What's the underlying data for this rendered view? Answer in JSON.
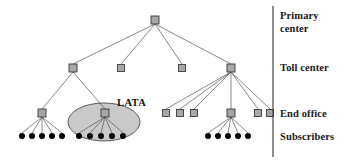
{
  "figure": {
    "background_color": "#ffffff",
    "width": 344,
    "height": 163
  },
  "style": {
    "switch_fill": "#a6a6a6",
    "switch_stroke": "#3b3b3b",
    "subscriber_fill": "#000000",
    "line_color": "#555555",
    "divider_color": "#333333",
    "lata_fill": "#c9c9c9",
    "lata_stroke": "#4a4a4a",
    "text_color": "#1a1a1a"
  },
  "divider": {
    "x": 273,
    "y1": 6,
    "y2": 157
  },
  "tier_labels": [
    {
      "id": "primary-center",
      "text": "Primary\ncenter",
      "x": 280,
      "y": 10
    },
    {
      "id": "toll-center",
      "text": "Toll center",
      "x": 280,
      "y": 62
    },
    {
      "id": "end-office",
      "text": "End office",
      "x": 280,
      "y": 108
    },
    {
      "id": "subscribers",
      "text": "Subscribers",
      "x": 280,
      "y": 131
    }
  ],
  "lata": {
    "label": "LATA",
    "label_x": 117,
    "label_y": 97,
    "ellipse": {
      "cx": 104,
      "cy": 122,
      "rx": 36,
      "ry": 19
    }
  },
  "nodes": {
    "primary_centers": [
      {
        "id": "pc-1",
        "x": 155,
        "y": 20,
        "size": 8
      }
    ],
    "toll_centers": [
      {
        "id": "tc-1",
        "x": 73,
        "y": 68,
        "size": 8
      },
      {
        "id": "tc-2",
        "x": 121,
        "y": 68,
        "size": 7
      },
      {
        "id": "tc-3",
        "x": 182,
        "y": 68,
        "size": 7
      },
      {
        "id": "tc-4",
        "x": 231,
        "y": 68,
        "size": 8
      }
    ],
    "end_offices": [
      {
        "id": "eo-1",
        "x": 42,
        "y": 113,
        "size": 8
      },
      {
        "id": "eo-2",
        "x": 105,
        "y": 113,
        "size": 8
      },
      {
        "id": "eo-3",
        "x": 166,
        "y": 113,
        "size": 7
      },
      {
        "id": "eo-4",
        "x": 180,
        "y": 113,
        "size": 7
      },
      {
        "id": "eo-5",
        "x": 194,
        "y": 113,
        "size": 7
      },
      {
        "id": "eo-6",
        "x": 231,
        "y": 113,
        "size": 8
      },
      {
        "id": "eo-7",
        "x": 258,
        "y": 113,
        "size": 7
      },
      {
        "id": "eo-8",
        "x": 270,
        "y": 113,
        "size": 7
      }
    ],
    "subscribers": [
      {
        "id": "sub-1",
        "x": 22,
        "y": 136,
        "r": 3
      },
      {
        "id": "sub-2",
        "x": 32,
        "y": 136,
        "r": 3
      },
      {
        "id": "sub-3",
        "x": 42,
        "y": 136,
        "r": 3
      },
      {
        "id": "sub-4",
        "x": 52,
        "y": 136,
        "r": 3
      },
      {
        "id": "sub-5",
        "x": 62,
        "y": 136,
        "r": 3
      },
      {
        "id": "sub-6",
        "x": 79,
        "y": 136,
        "r": 3
      },
      {
        "id": "sub-7",
        "x": 90,
        "y": 136,
        "r": 3
      },
      {
        "id": "sub-8",
        "x": 101,
        "y": 136,
        "r": 3
      },
      {
        "id": "sub-9",
        "x": 112,
        "y": 136,
        "r": 3
      },
      {
        "id": "sub-10",
        "x": 123,
        "y": 136,
        "r": 3
      },
      {
        "id": "sub-11",
        "x": 208,
        "y": 136,
        "r": 3
      },
      {
        "id": "sub-12",
        "x": 218,
        "y": 136,
        "r": 3
      },
      {
        "id": "sub-13",
        "x": 228,
        "y": 136,
        "r": 3
      },
      {
        "id": "sub-14",
        "x": 238,
        "y": 136,
        "r": 3
      },
      {
        "id": "sub-15",
        "x": 248,
        "y": 136,
        "r": 3
      }
    ]
  },
  "edges": [
    {
      "from": "pc-1",
      "to": "tc-1",
      "x1": 155,
      "y1": 24,
      "x2": 73,
      "y2": 64
    },
    {
      "from": "pc-1",
      "to": "tc-2",
      "x1": 155,
      "y1": 24,
      "x2": 121,
      "y2": 64
    },
    {
      "from": "pc-1",
      "to": "tc-3",
      "x1": 155,
      "y1": 24,
      "x2": 182,
      "y2": 64
    },
    {
      "from": "pc-1",
      "to": "tc-4",
      "x1": 155,
      "y1": 24,
      "x2": 231,
      "y2": 64
    },
    {
      "from": "tc-1",
      "to": "eo-1",
      "x1": 73,
      "y1": 72,
      "x2": 42,
      "y2": 109
    },
    {
      "from": "tc-1",
      "to": "eo-2",
      "x1": 73,
      "y1": 72,
      "x2": 105,
      "y2": 109
    },
    {
      "from": "tc-4",
      "to": "eo-3",
      "x1": 231,
      "y1": 72,
      "x2": 166,
      "y2": 109
    },
    {
      "from": "tc-4",
      "to": "eo-4",
      "x1": 231,
      "y1": 72,
      "x2": 180,
      "y2": 109
    },
    {
      "from": "tc-4",
      "to": "eo-5",
      "x1": 231,
      "y1": 72,
      "x2": 194,
      "y2": 109
    },
    {
      "from": "tc-4",
      "to": "eo-6",
      "x1": 231,
      "y1": 72,
      "x2": 231,
      "y2": 109
    },
    {
      "from": "tc-4",
      "to": "eo-7",
      "x1": 231,
      "y1": 72,
      "x2": 258,
      "y2": 109
    },
    {
      "from": "tc-4",
      "to": "eo-8",
      "x1": 231,
      "y1": 72,
      "x2": 270,
      "y2": 109
    },
    {
      "from": "eo-1",
      "to": "sub-1",
      "x1": 42,
      "y1": 117,
      "x2": 22,
      "y2": 133
    },
    {
      "from": "eo-1",
      "to": "sub-2",
      "x1": 42,
      "y1": 117,
      "x2": 32,
      "y2": 133
    },
    {
      "from": "eo-1",
      "to": "sub-3",
      "x1": 42,
      "y1": 117,
      "x2": 42,
      "y2": 133
    },
    {
      "from": "eo-1",
      "to": "sub-4",
      "x1": 42,
      "y1": 117,
      "x2": 52,
      "y2": 133
    },
    {
      "from": "eo-1",
      "to": "sub-5",
      "x1": 42,
      "y1": 117,
      "x2": 62,
      "y2": 133
    },
    {
      "from": "eo-2",
      "to": "sub-6",
      "x1": 105,
      "y1": 117,
      "x2": 79,
      "y2": 133
    },
    {
      "from": "eo-2",
      "to": "sub-7",
      "x1": 105,
      "y1": 117,
      "x2": 90,
      "y2": 133
    },
    {
      "from": "eo-2",
      "to": "sub-8",
      "x1": 105,
      "y1": 117,
      "x2": 101,
      "y2": 133
    },
    {
      "from": "eo-2",
      "to": "sub-9",
      "x1": 105,
      "y1": 117,
      "x2": 112,
      "y2": 133
    },
    {
      "from": "eo-2",
      "to": "sub-10",
      "x1": 105,
      "y1": 117,
      "x2": 123,
      "y2": 133
    },
    {
      "from": "eo-6",
      "to": "sub-11",
      "x1": 231,
      "y1": 117,
      "x2": 208,
      "y2": 133
    },
    {
      "from": "eo-6",
      "to": "sub-12",
      "x1": 231,
      "y1": 117,
      "x2": 218,
      "y2": 133
    },
    {
      "from": "eo-6",
      "to": "sub-13",
      "x1": 231,
      "y1": 117,
      "x2": 228,
      "y2": 133
    },
    {
      "from": "eo-6",
      "to": "sub-14",
      "x1": 231,
      "y1": 117,
      "x2": 238,
      "y2": 133
    },
    {
      "from": "eo-6",
      "to": "sub-15",
      "x1": 231,
      "y1": 117,
      "x2": 248,
      "y2": 133
    }
  ]
}
